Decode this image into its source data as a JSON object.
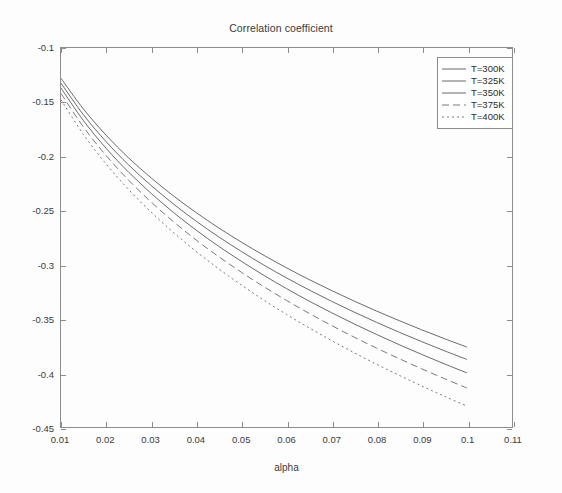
{
  "chart_data": {
    "type": "line",
    "title": "Correlation coefficient",
    "xlabel": "alpha",
    "ylabel": "",
    "xlim": [
      0.01,
      0.11
    ],
    "ylim": [
      -0.45,
      -0.1
    ],
    "grid": false,
    "legend_position": "top-right",
    "xticks": [
      "0.01",
      "0.02",
      "0.03",
      "0.04",
      "0.05",
      "0.06",
      "0.07",
      "0.08",
      "0.09",
      "0.1",
      "0.11"
    ],
    "xtick_values": [
      0.01,
      0.02,
      0.03,
      0.04,
      0.05,
      0.06,
      0.07,
      0.08,
      0.09,
      0.1,
      0.11
    ],
    "yticks": [
      "-0.1",
      "-0.15",
      "-0.2",
      "-0.25",
      "-0.3",
      "-0.35",
      "-0.4",
      "-0.45"
    ],
    "ytick_values": [
      -0.1,
      -0.15,
      -0.2,
      -0.25,
      -0.3,
      -0.35,
      -0.4,
      -0.45
    ],
    "x": [
      0.01,
      0.015,
      0.02,
      0.025,
      0.03,
      0.035,
      0.04,
      0.045,
      0.05,
      0.055,
      0.06,
      0.065,
      0.07,
      0.075,
      0.08,
      0.085,
      0.09,
      0.095,
      0.1
    ],
    "series": [
      {
        "name": "T=300K",
        "color": "#5a5a5a",
        "dash": "none",
        "values": [
          -0.128,
          -0.1565,
          -0.1805,
          -0.2015,
          -0.22,
          -0.2368,
          -0.2521,
          -0.2662,
          -0.2793,
          -0.2915,
          -0.303,
          -0.3138,
          -0.324,
          -0.3337,
          -0.343,
          -0.3518,
          -0.3603,
          -0.3684,
          -0.3762
        ]
      },
      {
        "name": "T=325K",
        "color": "#5a5a5a",
        "dash": "none",
        "values": [
          -0.1325,
          -0.1618,
          -0.1865,
          -0.208,
          -0.227,
          -0.2443,
          -0.26,
          -0.2745,
          -0.2879,
          -0.3005,
          -0.3123,
          -0.3234,
          -0.3339,
          -0.3439,
          -0.3534,
          -0.3625,
          -0.3712,
          -0.3796,
          -0.3876
        ]
      },
      {
        "name": "T=350K",
        "color": "#5a5a5a",
        "dash": "none",
        "values": [
          -0.137,
          -0.1672,
          -0.1926,
          -0.2147,
          -0.2343,
          -0.2521,
          -0.2683,
          -0.2832,
          -0.297,
          -0.31,
          -0.3222,
          -0.3337,
          -0.3445,
          -0.3548,
          -0.3646,
          -0.374,
          -0.383,
          -0.3917,
          -0.4
        ]
      },
      {
        "name": "T=375K",
        "color": "#6a6a6a",
        "dash": "dash",
        "values": [
          -0.142,
          -0.1731,
          -0.1993,
          -0.2221,
          -0.2423,
          -0.2606,
          -0.2774,
          -0.2928,
          -0.3071,
          -0.3205,
          -0.3331,
          -0.345,
          -0.3563,
          -0.367,
          -0.3772,
          -0.3869,
          -0.3963,
          -0.4053,
          -0.414
        ]
      },
      {
        "name": "T=400K",
        "color": "#6a6a6a",
        "dash": "dot",
        "values": [
          -0.1478,
          -0.18,
          -0.2071,
          -0.2307,
          -0.2516,
          -0.2706,
          -0.288,
          -0.304,
          -0.3189,
          -0.3329,
          -0.346,
          -0.3584,
          -0.3702,
          -0.3814,
          -0.3921,
          -0.4023,
          -0.4121,
          -0.4216,
          -0.4307
        ]
      }
    ]
  }
}
